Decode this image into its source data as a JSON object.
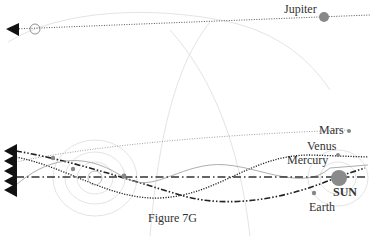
{
  "figure": {
    "caption": "Figure 7G"
  },
  "labels": {
    "jupiter": "Jupiter",
    "mars": "Mars",
    "venus": "Venus",
    "mercury": "Mercury",
    "sun": "SUN",
    "earth": "Earth"
  },
  "colors": {
    "line": "#222222",
    "faint": "#d8d8d8",
    "planet": "#888888",
    "sun": "#8a8a8a",
    "text": "#333333"
  }
}
